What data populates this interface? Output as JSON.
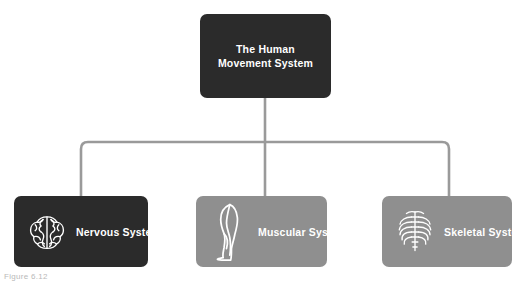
{
  "diagram": {
    "type": "hierarchy-tree",
    "root": {
      "label": "The Human Movement System",
      "line1": "The Human",
      "line2": "Movement System",
      "color": "#2b2b2b",
      "text_color": "#ffffff"
    },
    "children": [
      {
        "label": "Nervous System",
        "icon": "brain-icon",
        "color": "#2b2b2b",
        "text_color": "#ffffff"
      },
      {
        "label": "Muscular System",
        "icon": "leg-muscle-icon",
        "color": "#8f8f8f",
        "text_color": "#ffffff"
      },
      {
        "label": "Skeletal System",
        "icon": "ribcage-icon",
        "color": "#8f8f8f",
        "text_color": "#ffffff"
      }
    ],
    "connector_color": "#9a9a9a"
  },
  "caption": {
    "text": "Figure 6.12"
  }
}
